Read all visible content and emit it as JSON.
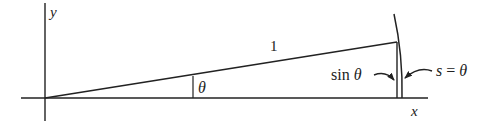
{
  "figure": {
    "width": 491,
    "height": 127,
    "stroke_color": "#222222",
    "background": "#ffffff"
  },
  "geometry": {
    "origin": {
      "x": 45,
      "y": 98
    },
    "x_axis": {
      "x1": 21,
      "x2": 428,
      "y": 98
    },
    "y_axis": {
      "x": 45,
      "y1": 3,
      "y2": 121
    },
    "radius_line": {
      "x1": 45,
      "y1": 98,
      "x2": 397,
      "y2": 42
    },
    "sin_segment": {
      "x": 397,
      "y1": 42,
      "y2": 98
    },
    "unit_arc": {
      "start_x": 394,
      "start_y": 14,
      "ctrl_x": 403,
      "ctrl_y": 55,
      "end_x": 402,
      "end_y": 98
    },
    "angle_marker": {
      "x": 193,
      "y1": 76,
      "y2": 98
    },
    "arrow_sin": {
      "path": "M 374 75 C 382 72, 388 73, 394 80"
    },
    "arrow_s": {
      "path": "M 432 71 C 424 68, 414 70, 405 78"
    }
  },
  "labels": {
    "y_axis": {
      "text": "y",
      "x": 50,
      "y": 17,
      "size": 15,
      "italic": true
    },
    "x_axis": {
      "text": "x",
      "x": 411,
      "y": 116,
      "size": 15,
      "italic": true
    },
    "radius": {
      "text": "1",
      "x": 270,
      "y": 51,
      "size": 15,
      "italic": false
    },
    "angle": {
      "text": "θ",
      "x": 198,
      "y": 93,
      "size": 16,
      "italic": true
    },
    "sin_theta": {
      "prefix": "sin ",
      "symbol": "θ",
      "x": 331,
      "y": 80,
      "size": 16
    },
    "arc_length": {
      "var": "s",
      "eq": " = ",
      "symbol": "θ",
      "x": 436,
      "y": 76,
      "size": 16
    }
  }
}
